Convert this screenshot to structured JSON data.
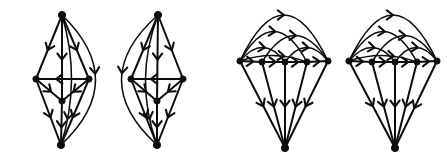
{
  "figure": {
    "background_color": "#ffffff",
    "ink_color": "#0d0d0d",
    "width": 447,
    "height": 166,
    "panel_count": 4,
    "panels": [
      {
        "id": "digraph-1",
        "name": "bipyramid-left-arc",
        "vertex_count": 5,
        "edge_count": 11,
        "vertices": [
          {
            "id": "t",
            "label": "top",
            "x": 62,
            "y": 15
          },
          {
            "id": "l",
            "label": "left",
            "x": 36,
            "y": 79
          },
          {
            "id": "r",
            "label": "right",
            "x": 89,
            "y": 79
          },
          {
            "id": "c",
            "label": "center",
            "x": 62,
            "y": 101
          },
          {
            "id": "b",
            "label": "bottom",
            "x": 61,
            "y": 145
          }
        ],
        "edges": [
          {
            "from": "t",
            "to": "l",
            "shape": "line",
            "arrow_at": 0.55
          },
          {
            "from": "t",
            "to": "r",
            "shape": "line",
            "arrow_at": 0.55
          },
          {
            "from": "t",
            "to": "c",
            "shape": "line",
            "arrow_at": 0.52
          },
          {
            "from": "t",
            "to": "b",
            "shape": "arc",
            "bow": -34,
            "arrow_at": 0.45
          },
          {
            "from": "r",
            "to": "l",
            "shape": "line",
            "arrow_at": 0.62
          },
          {
            "from": "l",
            "to": "c",
            "shape": "line",
            "arrow_at": 0.58
          },
          {
            "from": "r",
            "to": "c",
            "shape": "line",
            "arrow_at": 0.58
          },
          {
            "from": "c",
            "to": "b",
            "shape": "line",
            "arrow_at": 0.6
          },
          {
            "from": "l",
            "to": "b",
            "shape": "line",
            "arrow_at": 0.58
          },
          {
            "from": "r",
            "to": "b",
            "shape": "line",
            "arrow_at": 0.58
          },
          {
            "from": "t",
            "to": "b",
            "shape": "arc",
            "bow": -10,
            "arrow_at": 0.8
          }
        ]
      },
      {
        "id": "digraph-2",
        "name": "bipyramid-right-arc",
        "vertex_count": 5,
        "edge_count": 11,
        "vertices": [
          {
            "id": "t",
            "label": "top",
            "x": 158,
            "y": 15
          },
          {
            "id": "l",
            "label": "left",
            "x": 131,
            "y": 79
          },
          {
            "id": "r",
            "label": "right",
            "x": 183,
            "y": 79
          },
          {
            "id": "c",
            "label": "center",
            "x": 157,
            "y": 101
          },
          {
            "id": "b",
            "label": "bottom",
            "x": 157,
            "y": 145
          }
        ],
        "edges": [
          {
            "from": "t",
            "to": "l",
            "shape": "line",
            "arrow_at": 0.55
          },
          {
            "from": "t",
            "to": "r",
            "shape": "line",
            "arrow_at": 0.55
          },
          {
            "from": "t",
            "to": "c",
            "shape": "line",
            "arrow_at": 0.52
          },
          {
            "from": "t",
            "to": "b",
            "shape": "arc",
            "bow": 36,
            "arrow_at": 0.45
          },
          {
            "from": "r",
            "to": "l",
            "shape": "line",
            "arrow_at": 0.62
          },
          {
            "from": "l",
            "to": "c",
            "shape": "line",
            "arrow_at": 0.58
          },
          {
            "from": "r",
            "to": "c",
            "shape": "line",
            "arrow_at": 0.58
          },
          {
            "from": "c",
            "to": "b",
            "shape": "line",
            "arrow_at": 0.6
          },
          {
            "from": "l",
            "to": "b",
            "shape": "line",
            "arrow_at": 0.58
          },
          {
            "from": "r",
            "to": "b",
            "shape": "line",
            "arrow_at": 0.58
          },
          {
            "from": "t",
            "to": "b",
            "shape": "arc",
            "bow": 12,
            "arrow_at": 0.8
          }
        ]
      },
      {
        "id": "digraph-3",
        "name": "parachute-left",
        "vertex_count": 6,
        "edge_count": 15,
        "vertices": [
          {
            "id": "v1",
            "label": "row-1",
            "x": 240,
            "y": 61
          },
          {
            "id": "v2",
            "label": "row-2",
            "x": 262,
            "y": 62
          },
          {
            "id": "v3",
            "label": "row-3",
            "x": 285,
            "y": 62
          },
          {
            "id": "v4",
            "label": "row-4",
            "x": 307,
            "y": 62
          },
          {
            "id": "v5",
            "label": "row-5",
            "x": 328,
            "y": 61
          },
          {
            "id": "a",
            "label": "apex",
            "x": 285,
            "y": 148
          }
        ],
        "edges": [
          {
            "from": "v1",
            "to": "v5",
            "shape": "arc",
            "bow": -46,
            "arrow_at": 0.5
          },
          {
            "from": "v1",
            "to": "v4",
            "shape": "arc",
            "bow": -30,
            "arrow_at": 0.52
          },
          {
            "from": "v2",
            "to": "v5",
            "shape": "arc",
            "bow": -26,
            "arrow_at": 0.52
          },
          {
            "from": "v1",
            "to": "v3",
            "shape": "arc",
            "bow": -14,
            "arrow_at": 0.55
          },
          {
            "from": "v3",
            "to": "v5",
            "shape": "arc",
            "bow": -14,
            "arrow_at": 0.55
          },
          {
            "from": "v1",
            "to": "v2",
            "shape": "line",
            "arrow_at": 0.6
          },
          {
            "from": "v2",
            "to": "v3",
            "shape": "line",
            "arrow_at": 0.6
          },
          {
            "from": "v3",
            "to": "v4",
            "shape": "line",
            "arrow_at": 0.6
          },
          {
            "from": "v4",
            "to": "v5",
            "shape": "line",
            "arrow_at": 0.6
          },
          {
            "from": "v1",
            "to": "v4",
            "shape": "arc",
            "bow": -6,
            "arrow_at": 0.66
          },
          {
            "from": "v1",
            "to": "a",
            "shape": "line",
            "arrow_at": 0.52
          },
          {
            "from": "v2",
            "to": "a",
            "shape": "line",
            "arrow_at": 0.52
          },
          {
            "from": "v3",
            "to": "a",
            "shape": "line",
            "arrow_at": 0.52
          },
          {
            "from": "v4",
            "to": "a",
            "shape": "line",
            "arrow_at": 0.52
          },
          {
            "from": "v5",
            "to": "a",
            "shape": "line",
            "arrow_at": 0.52
          }
        ]
      },
      {
        "id": "digraph-4",
        "name": "parachute-right",
        "vertex_count": 6,
        "edge_count": 15,
        "vertices": [
          {
            "id": "v1",
            "label": "row-1",
            "x": 349,
            "y": 61
          },
          {
            "id": "v2",
            "label": "row-2",
            "x": 372,
            "y": 62
          },
          {
            "id": "v3",
            "label": "row-3",
            "x": 395,
            "y": 62
          },
          {
            "id": "v4",
            "label": "row-4",
            "x": 417,
            "y": 62
          },
          {
            "id": "v5",
            "label": "row-5",
            "x": 437,
            "y": 61
          },
          {
            "id": "a",
            "label": "apex",
            "x": 395,
            "y": 148
          }
        ],
        "edges": [
          {
            "from": "v1",
            "to": "v5",
            "shape": "arc",
            "bow": -46,
            "arrow_at": 0.5
          },
          {
            "from": "v1",
            "to": "v4",
            "shape": "arc",
            "bow": -30,
            "arrow_at": 0.52
          },
          {
            "from": "v2",
            "to": "v5",
            "shape": "arc",
            "bow": -26,
            "arrow_at": 0.52
          },
          {
            "from": "v1",
            "to": "v3",
            "shape": "arc",
            "bow": -14,
            "arrow_at": 0.55
          },
          {
            "from": "v3",
            "to": "v5",
            "shape": "arc",
            "bow": -14,
            "arrow_at": 0.55
          },
          {
            "from": "v1",
            "to": "v2",
            "shape": "line",
            "arrow_at": 0.6
          },
          {
            "from": "v2",
            "to": "v3",
            "shape": "line",
            "arrow_at": 0.6
          },
          {
            "from": "v3",
            "to": "v4",
            "shape": "line",
            "arrow_at": 0.6
          },
          {
            "from": "v4",
            "to": "v5",
            "shape": "line",
            "arrow_at": 0.6
          },
          {
            "from": "v1",
            "to": "v4",
            "shape": "arc",
            "bow": -6,
            "arrow_at": 0.66
          },
          {
            "from": "v1",
            "to": "a",
            "shape": "line",
            "arrow_at": 0.52
          },
          {
            "from": "v2",
            "to": "a",
            "shape": "line",
            "arrow_at": 0.52
          },
          {
            "from": "v3",
            "to": "a",
            "shape": "line",
            "arrow_at": 0.52
          },
          {
            "from": "v4",
            "to": "a",
            "shape": "line",
            "arrow_at": 0.52
          },
          {
            "from": "v5",
            "to": "a",
            "shape": "line",
            "arrow_at": 0.54
          }
        ]
      }
    ]
  }
}
